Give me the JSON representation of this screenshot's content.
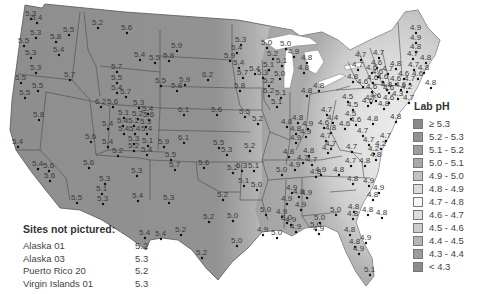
{
  "legend": {
    "title": "Lab pH",
    "items": [
      {
        "label": "≥ 5.3",
        "color": "#8a8a8a"
      },
      {
        "label": "5.2 - 5.3",
        "color": "#939393"
      },
      {
        "label": "5.1 - 5.2",
        "color": "#9d9d9d"
      },
      {
        "label": "5.0 - 5.1",
        "color": "#a9a9a9"
      },
      {
        "label": "4.9 - 5.0",
        "color": "#c2c2c2"
      },
      {
        "label": "4.8 - 4.9",
        "color": "#dcdcdc"
      },
      {
        "label": "4.7 - 4.8",
        "color": "#f6f6f6"
      },
      {
        "label": "4.6 - 4.7",
        "color": "#dedede"
      },
      {
        "label": "4.5 - 4.6",
        "color": "#cccccc"
      },
      {
        "label": "4.4 - 4.5",
        "color": "#b6b6b6"
      },
      {
        "label": "4.3 - 4.4",
        "color": "#9c9c9c"
      },
      {
        "label": "< 4.3",
        "color": "#8c8c8c"
      }
    ]
  },
  "sites_not_pictured": {
    "title": "Sites not pictured:",
    "items": [
      {
        "name": "Alaska 01",
        "value": "5.2"
      },
      {
        "name": "Alaska 03",
        "value": "5.3"
      },
      {
        "name": "Puerto Rico 20",
        "value": "5.2"
      },
      {
        "name": "Virgin Islands 01",
        "value": "5.3"
      }
    ]
  },
  "sites": [
    {
      "x": 30,
      "y": 16,
      "v": "5.3"
    },
    {
      "x": 36,
      "y": 20,
      "v": "5.4"
    },
    {
      "x": 35,
      "y": 35,
      "v": "5.3"
    },
    {
      "x": 23,
      "y": 43,
      "v": "5.5"
    },
    {
      "x": 30,
      "y": 55,
      "v": "5.3"
    },
    {
      "x": 35,
      "y": 70,
      "v": "5.3"
    },
    {
      "x": 20,
      "y": 80,
      "v": "5.5"
    },
    {
      "x": 24,
      "y": 95,
      "v": "5.5"
    },
    {
      "x": 68,
      "y": 32,
      "v": "5.5"
    },
    {
      "x": 58,
      "y": 52,
      "v": "5.4"
    },
    {
      "x": 69,
      "y": 77,
      "v": "5.7"
    },
    {
      "x": 97,
      "y": 25,
      "v": "5.2"
    },
    {
      "x": 126,
      "y": 30,
      "v": "5.6"
    },
    {
      "x": 139,
      "y": 57,
      "v": "5.4"
    },
    {
      "x": 116,
      "y": 69,
      "v": "5.7"
    },
    {
      "x": 116,
      "y": 80,
      "v": "5.5"
    },
    {
      "x": 116,
      "y": 90,
      "v": "5.4"
    },
    {
      "x": 125,
      "y": 94,
      "v": "5.7"
    },
    {
      "x": 154,
      "y": 60,
      "v": "5.5"
    },
    {
      "x": 100,
      "y": 104,
      "v": "6.2"
    },
    {
      "x": 112,
      "y": 104,
      "v": "5.6"
    },
    {
      "x": 138,
      "y": 105,
      "v": "5.3"
    },
    {
      "x": 147,
      "y": 111,
      "v": "5.4"
    },
    {
      "x": 123,
      "y": 115,
      "v": "5.1"
    },
    {
      "x": 137,
      "y": 116,
      "v": "5.2"
    },
    {
      "x": 148,
      "y": 117,
      "v": "5.6"
    },
    {
      "x": 122,
      "y": 123,
      "v": "5.4"
    },
    {
      "x": 133,
      "y": 123,
      "v": "5.2"
    },
    {
      "x": 145,
      "y": 124,
      "v": "5.3"
    },
    {
      "x": 123,
      "y": 131,
      "v": "5.4"
    },
    {
      "x": 134,
      "y": 131,
      "v": "5.4"
    },
    {
      "x": 146,
      "y": 131,
      "v": "5.4"
    },
    {
      "x": 107,
      "y": 126,
      "v": "5.4"
    },
    {
      "x": 107,
      "y": 144,
      "v": "5.4"
    },
    {
      "x": 133,
      "y": 141,
      "v": "5.3"
    },
    {
      "x": 147,
      "y": 143,
      "v": "5.1"
    },
    {
      "x": 133,
      "y": 148,
      "v": "5.2"
    },
    {
      "x": 146,
      "y": 152,
      "v": "5.4"
    },
    {
      "x": 117,
      "y": 153,
      "v": "5.2"
    },
    {
      "x": 163,
      "y": 144,
      "v": "5.9"
    },
    {
      "x": 90,
      "y": 139,
      "v": "5.6"
    },
    {
      "x": 55,
      "y": 39,
      "v": "5.8"
    },
    {
      "x": 37,
      "y": 88,
      "v": "5.5"
    },
    {
      "x": 38,
      "y": 117,
      "v": "5.8"
    },
    {
      "x": 17,
      "y": 144,
      "v": "5.4"
    },
    {
      "x": 37,
      "y": 166,
      "v": "5.4"
    },
    {
      "x": 48,
      "y": 168,
      "v": "5.6"
    },
    {
      "x": 49,
      "y": 178,
      "v": "5.6"
    },
    {
      "x": 88,
      "y": 165,
      "v": "5.6"
    },
    {
      "x": 104,
      "y": 181,
      "v": "5.3"
    },
    {
      "x": 101,
      "y": 191,
      "v": "5.1"
    },
    {
      "x": 102,
      "y": 201,
      "v": "5.3"
    },
    {
      "x": 76,
      "y": 200,
      "v": "5.5"
    },
    {
      "x": 136,
      "y": 173,
      "v": "5.3"
    },
    {
      "x": 137,
      "y": 198,
      "v": "5.4"
    },
    {
      "x": 170,
      "y": 157,
      "v": "5.5"
    },
    {
      "x": 174,
      "y": 167,
      "v": "5.7"
    },
    {
      "x": 203,
      "y": 165,
      "v": "5.6"
    },
    {
      "x": 168,
      "y": 200,
      "v": "5.3"
    },
    {
      "x": 144,
      "y": 235,
      "v": "5.4"
    },
    {
      "x": 160,
      "y": 236,
      "v": "5.4"
    },
    {
      "x": 180,
      "y": 232,
      "v": "5.2"
    },
    {
      "x": 208,
      "y": 219,
      "v": "5.2"
    },
    {
      "x": 201,
      "y": 255,
      "v": "5.2"
    },
    {
      "x": 236,
      "y": 243,
      "v": "5.0"
    },
    {
      "x": 232,
      "y": 218,
      "v": "5.0"
    },
    {
      "x": 222,
      "y": 197,
      "v": "5.2"
    },
    {
      "x": 176,
      "y": 48,
      "v": "5.9"
    },
    {
      "x": 168,
      "y": 58,
      "v": "5.8"
    },
    {
      "x": 207,
      "y": 77,
      "v": "6.2"
    },
    {
      "x": 184,
      "y": 82,
      "v": "5.9"
    },
    {
      "x": 176,
      "y": 88,
      "v": "5.8"
    },
    {
      "x": 160,
      "y": 83,
      "v": "5.5"
    },
    {
      "x": 183,
      "y": 112,
      "v": "6.1"
    },
    {
      "x": 183,
      "y": 140,
      "v": "6.1"
    },
    {
      "x": 216,
      "y": 112,
      "v": "5.6"
    },
    {
      "x": 218,
      "y": 145,
      "v": "5.5"
    },
    {
      "x": 226,
      "y": 152,
      "v": "5.3"
    },
    {
      "x": 244,
      "y": 114,
      "v": "5.5"
    },
    {
      "x": 257,
      "y": 121,
      "v": "5.2"
    },
    {
      "x": 249,
      "y": 148,
      "v": "5.2"
    },
    {
      "x": 232,
      "y": 170,
      "v": "5.2"
    },
    {
      "x": 241,
      "y": 168,
      "v": "5.3"
    },
    {
      "x": 253,
      "y": 168,
      "v": "5.1"
    },
    {
      "x": 243,
      "y": 183,
      "v": "5.1"
    },
    {
      "x": 256,
      "y": 187,
      "v": "5.0"
    },
    {
      "x": 239,
      "y": 88,
      "v": "5.8"
    },
    {
      "x": 240,
      "y": 42,
      "v": "5.3"
    },
    {
      "x": 236,
      "y": 50,
      "v": "5.4"
    },
    {
      "x": 229,
      "y": 58,
      "v": "5.9"
    },
    {
      "x": 238,
      "y": 65,
      "v": "5.4"
    },
    {
      "x": 242,
      "y": 75,
      "v": "5.7"
    },
    {
      "x": 254,
      "y": 71,
      "v": "5.4"
    },
    {
      "x": 266,
      "y": 45,
      "v": "5.0"
    },
    {
      "x": 285,
      "y": 46,
      "v": "5.0"
    },
    {
      "x": 272,
      "y": 56,
      "v": "5.2"
    },
    {
      "x": 281,
      "y": 63,
      "v": "5.1"
    },
    {
      "x": 268,
      "y": 67,
      "v": "5.1"
    },
    {
      "x": 262,
      "y": 75,
      "v": "5.3"
    },
    {
      "x": 279,
      "y": 76,
      "v": "5.0"
    },
    {
      "x": 268,
      "y": 83,
      "v": "5.2"
    },
    {
      "x": 268,
      "y": 93,
      "v": "5.2"
    },
    {
      "x": 280,
      "y": 95,
      "v": "5.1"
    },
    {
      "x": 276,
      "y": 104,
      "v": "5.1"
    },
    {
      "x": 293,
      "y": 54,
      "v": "4.9"
    },
    {
      "x": 306,
      "y": 60,
      "v": "4.8"
    },
    {
      "x": 303,
      "y": 70,
      "v": "4.8"
    },
    {
      "x": 318,
      "y": 88,
      "v": "4.8"
    },
    {
      "x": 306,
      "y": 93,
      "v": "4.8"
    },
    {
      "x": 286,
      "y": 124,
      "v": "4.8"
    },
    {
      "x": 295,
      "y": 131,
      "v": "4.8"
    },
    {
      "x": 288,
      "y": 154,
      "v": "4.8"
    },
    {
      "x": 281,
      "y": 172,
      "v": "5.0"
    },
    {
      "x": 291,
      "y": 190,
      "v": "4.9"
    },
    {
      "x": 286,
      "y": 201,
      "v": "4.9"
    },
    {
      "x": 265,
      "y": 212,
      "v": "5.0"
    },
    {
      "x": 281,
      "y": 214,
      "v": "4.9"
    },
    {
      "x": 286,
      "y": 220,
      "v": "5.0"
    },
    {
      "x": 262,
      "y": 232,
      "v": "4.9"
    },
    {
      "x": 276,
      "y": 235,
      "v": "5.0"
    },
    {
      "x": 290,
      "y": 222,
      "v": "4.9"
    },
    {
      "x": 298,
      "y": 194,
      "v": "4.8"
    },
    {
      "x": 306,
      "y": 195,
      "v": "4.9"
    },
    {
      "x": 300,
      "y": 207,
      "v": "4.9"
    },
    {
      "x": 295,
      "y": 229,
      "v": "4.9"
    },
    {
      "x": 315,
      "y": 227,
      "v": "5.0"
    },
    {
      "x": 319,
      "y": 220,
      "v": "5.0"
    },
    {
      "x": 335,
      "y": 212,
      "v": "5.0"
    },
    {
      "x": 353,
      "y": 209,
      "v": "4.8"
    },
    {
      "x": 352,
      "y": 216,
      "v": "4.8"
    },
    {
      "x": 318,
      "y": 231,
      "v": "4.9"
    },
    {
      "x": 349,
      "y": 232,
      "v": "4.8"
    },
    {
      "x": 354,
      "y": 244,
      "v": "4.8"
    },
    {
      "x": 358,
      "y": 251,
      "v": "4.9"
    },
    {
      "x": 365,
      "y": 240,
      "v": "4.9"
    },
    {
      "x": 369,
      "y": 272,
      "v": "5.1"
    },
    {
      "x": 305,
      "y": 134,
      "v": "4.9"
    },
    {
      "x": 297,
      "y": 120,
      "v": "4.8"
    },
    {
      "x": 307,
      "y": 126,
      "v": "4.9"
    },
    {
      "x": 295,
      "y": 140,
      "v": "4.9"
    },
    {
      "x": 308,
      "y": 153,
      "v": "4.8"
    },
    {
      "x": 302,
      "y": 160,
      "v": "4.7"
    },
    {
      "x": 311,
      "y": 162,
      "v": "4.7"
    },
    {
      "x": 294,
      "y": 167,
      "v": "4.9"
    },
    {
      "x": 315,
      "y": 174,
      "v": "4.8"
    },
    {
      "x": 320,
      "y": 172,
      "v": "4.9"
    },
    {
      "x": 326,
      "y": 112,
      "v": "4.7"
    },
    {
      "x": 332,
      "y": 120,
      "v": "4.4"
    },
    {
      "x": 323,
      "y": 125,
      "v": "4.6"
    },
    {
      "x": 330,
      "y": 130,
      "v": "4.8"
    },
    {
      "x": 325,
      "y": 138,
      "v": "4.7"
    },
    {
      "x": 330,
      "y": 146,
      "v": "4.7"
    },
    {
      "x": 327,
      "y": 150,
      "v": "4.7"
    },
    {
      "x": 347,
      "y": 99,
      "v": "4.5"
    },
    {
      "x": 352,
      "y": 107,
      "v": "4.5"
    },
    {
      "x": 350,
      "y": 116,
      "v": "4.5"
    },
    {
      "x": 355,
      "y": 122,
      "v": "4.6"
    },
    {
      "x": 344,
      "y": 126,
      "v": "4.6"
    },
    {
      "x": 362,
      "y": 133,
      "v": "4.7"
    },
    {
      "x": 372,
      "y": 121,
      "v": "4.8"
    },
    {
      "x": 368,
      "y": 142,
      "v": "4.7"
    },
    {
      "x": 373,
      "y": 151,
      "v": "4.2"
    },
    {
      "x": 351,
      "y": 149,
      "v": "4.7"
    },
    {
      "x": 367,
      "y": 103,
      "v": "4.6"
    },
    {
      "x": 375,
      "y": 98,
      "v": "4.6"
    },
    {
      "x": 383,
      "y": 106,
      "v": "4.8"
    },
    {
      "x": 388,
      "y": 100,
      "v": "4.6"
    },
    {
      "x": 395,
      "y": 119,
      "v": "4.8"
    },
    {
      "x": 385,
      "y": 138,
      "v": "4.7"
    },
    {
      "x": 380,
      "y": 146,
      "v": "4.2"
    },
    {
      "x": 375,
      "y": 157,
      "v": "4.8"
    },
    {
      "x": 364,
      "y": 163,
      "v": "4.8"
    },
    {
      "x": 350,
      "y": 163,
      "v": "4.7"
    },
    {
      "x": 338,
      "y": 172,
      "v": "4.8"
    },
    {
      "x": 352,
      "y": 181,
      "v": "4.8"
    },
    {
      "x": 368,
      "y": 183,
      "v": "4.9"
    },
    {
      "x": 378,
      "y": 190,
      "v": "4.9"
    },
    {
      "x": 372,
      "y": 197,
      "v": "4.8"
    },
    {
      "x": 367,
      "y": 212,
      "v": "4.8"
    },
    {
      "x": 381,
      "y": 215,
      "v": "4.8"
    },
    {
      "x": 386,
      "y": 87,
      "v": "4.8"
    },
    {
      "x": 395,
      "y": 81,
      "v": "4.6"
    },
    {
      "x": 382,
      "y": 79,
      "v": "4.6"
    },
    {
      "x": 372,
      "y": 80,
      "v": "4.6"
    },
    {
      "x": 362,
      "y": 84,
      "v": "4.6"
    },
    {
      "x": 371,
      "y": 89,
      "v": "4.6"
    },
    {
      "x": 387,
      "y": 71,
      "v": "4.7"
    },
    {
      "x": 395,
      "y": 66,
      "v": "4.8"
    },
    {
      "x": 378,
      "y": 55,
      "v": "4.7"
    },
    {
      "x": 376,
      "y": 65,
      "v": "4.6"
    },
    {
      "x": 360,
      "y": 57,
      "v": "4.7"
    },
    {
      "x": 371,
      "y": 70,
      "v": "4.6"
    },
    {
      "x": 357,
      "y": 67,
      "v": "4.7"
    },
    {
      "x": 352,
      "y": 79,
      "v": "4.8"
    },
    {
      "x": 370,
      "y": 100,
      "v": "4.7"
    },
    {
      "x": 415,
      "y": 30,
      "v": "4.9"
    },
    {
      "x": 415,
      "y": 40,
      "v": "4.9"
    },
    {
      "x": 415,
      "y": 49,
      "v": "4.8"
    },
    {
      "x": 412,
      "y": 56,
      "v": "4.7"
    },
    {
      "x": 425,
      "y": 60,
      "v": "4.8"
    },
    {
      "x": 413,
      "y": 67,
      "v": "4.7"
    },
    {
      "x": 423,
      "y": 70,
      "v": "4.8"
    },
    {
      "x": 417,
      "y": 76,
      "v": "4.6"
    },
    {
      "x": 430,
      "y": 85,
      "v": "4.8"
    },
    {
      "x": 409,
      "y": 81,
      "v": "4.7"
    },
    {
      "x": 406,
      "y": 89,
      "v": "4.2"
    },
    {
      "x": 408,
      "y": 100,
      "v": "4.7"
    },
    {
      "x": 397,
      "y": 96,
      "v": "4.3"
    },
    {
      "x": 400,
      "y": 87,
      "v": "4.6"
    },
    {
      "x": 388,
      "y": 90,
      "v": "4.6"
    },
    {
      "x": 377,
      "y": 74,
      "v": "4.6"
    },
    {
      "x": 403,
      "y": 76,
      "v": "4.6"
    }
  ]
}
